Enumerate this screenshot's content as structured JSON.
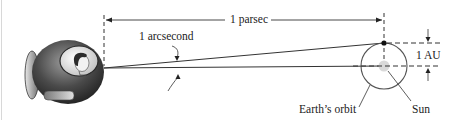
{
  "diagram": {
    "labels": {
      "parsec": "1 parsec",
      "arcsecond": "1 arcsecond",
      "au": "1 AU",
      "earth_orbit": "Earth’s orbit",
      "sun": "Sun"
    },
    "elements": {
      "observer": "spaceship with astronaut",
      "earth": "Earth position dot on orbit",
      "sun": "gray Sun disc at orbit center"
    },
    "colors": {
      "line": "#333333",
      "sun": "#d9d9d9",
      "orbit": "#555555",
      "ship_dark": "#3a3a3a",
      "ship_light": "#bdbdbd"
    }
  }
}
